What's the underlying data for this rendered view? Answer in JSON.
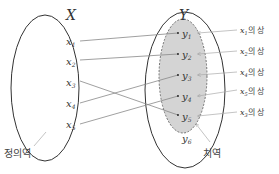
{
  "diagram": {
    "type": "function-mapping",
    "domain_set": {
      "name": "X",
      "label": "정의역",
      "elements": [
        "x",
        "x",
        "x",
        "x",
        "x"
      ],
      "subscripts": [
        "1",
        "2",
        "3",
        "4",
        "5"
      ]
    },
    "codomain_set": {
      "name": "Y",
      "range_label": "치역",
      "elements": [
        "y",
        "y",
        "y",
        "y",
        "y",
        "y"
      ],
      "subscripts": [
        "1",
        "2",
        "3",
        "4",
        "5",
        "6"
      ]
    },
    "mappings": [
      {
        "from": "x1",
        "to": "y1"
      },
      {
        "from": "x2",
        "to": "y2"
      },
      {
        "from": "x3",
        "to": "y5"
      },
      {
        "from": "x4",
        "to": "y3"
      },
      {
        "from": "x5",
        "to": "y4"
      }
    ],
    "image_labels": [
      {
        "var": "x",
        "sub": "1",
        "suffix": "의 상",
        "target": "y1"
      },
      {
        "var": "x",
        "sub": "2",
        "suffix": "의 상",
        "target": "y2"
      },
      {
        "var": "x",
        "sub": "4",
        "suffix": "의 상",
        "target": "y3"
      },
      {
        "var": "x",
        "sub": "5",
        "suffix": "의 상",
        "target": "y4"
      },
      {
        "var": "x",
        "sub": "3",
        "suffix": "의 상",
        "target": "y5"
      }
    ],
    "colors": {
      "range_fill": "#d4d4d4",
      "line": "#333333",
      "arrow": "#888888"
    }
  }
}
